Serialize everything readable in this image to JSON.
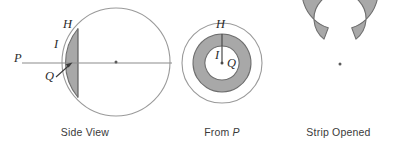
{
  "figure": {
    "width": 405,
    "height": 146,
    "background_color": "#ffffff"
  },
  "colors": {
    "shade_fill": "#a8a8a8",
    "shade_stroke": "#6e6e6e",
    "outline_stroke": "#9a9a9a",
    "axis_stroke": "#8c8c8c",
    "label_color": "#2b2b2b",
    "caption_color": "#3a3a3a"
  },
  "panels": [
    {
      "id": "side-view",
      "caption": "Side View",
      "caption_prefix": "Side View",
      "caption_italic": "",
      "labels": [
        {
          "name": "P",
          "text": "P",
          "x": 14,
          "y": 62
        },
        {
          "name": "H",
          "text": "H",
          "x": 63,
          "y": 28
        },
        {
          "name": "I",
          "text": "I",
          "x": 54,
          "y": 48
        },
        {
          "name": "Q",
          "text": "Q",
          "x": 49,
          "y": 79
        }
      ],
      "geometry": {
        "circle_center_x": 116,
        "circle_center_y": 62,
        "circle_radius": 54,
        "chord_x": 78,
        "axis_y": 63,
        "axis_x_start": 22,
        "axis_x_end": 172,
        "center_dot": true
      }
    },
    {
      "id": "from-p",
      "caption": "From P",
      "caption_prefix": "From ",
      "caption_italic": "P",
      "labels": [
        {
          "name": "H",
          "text": "H",
          "x": 216,
          "y": 27
        },
        {
          "name": "I",
          "text": "I",
          "x": 214,
          "y": 55
        },
        {
          "name": "Q",
          "text": "Q",
          "x": 228,
          "y": 62
        }
      ],
      "geometry": {
        "circle_center_x": 222,
        "circle_center_y": 63,
        "outer_radius": 40,
        "annulus_outer_radius": 29,
        "annulus_inner_radius": 17,
        "radial_line_from_y": 34,
        "radial_line_to_y": 62,
        "center_dot": true
      }
    },
    {
      "id": "strip-opened",
      "caption": "Strip Opened",
      "caption_prefix": "Strip Opened",
      "caption_italic": "",
      "labels": [],
      "geometry": {
        "center_x": 340,
        "center_y": 64,
        "outer_radius": 38,
        "inner_radius": 26,
        "gap_start_angle_deg": 72,
        "gap_end_angle_deg": 108,
        "center_dot": true
      }
    }
  ]
}
